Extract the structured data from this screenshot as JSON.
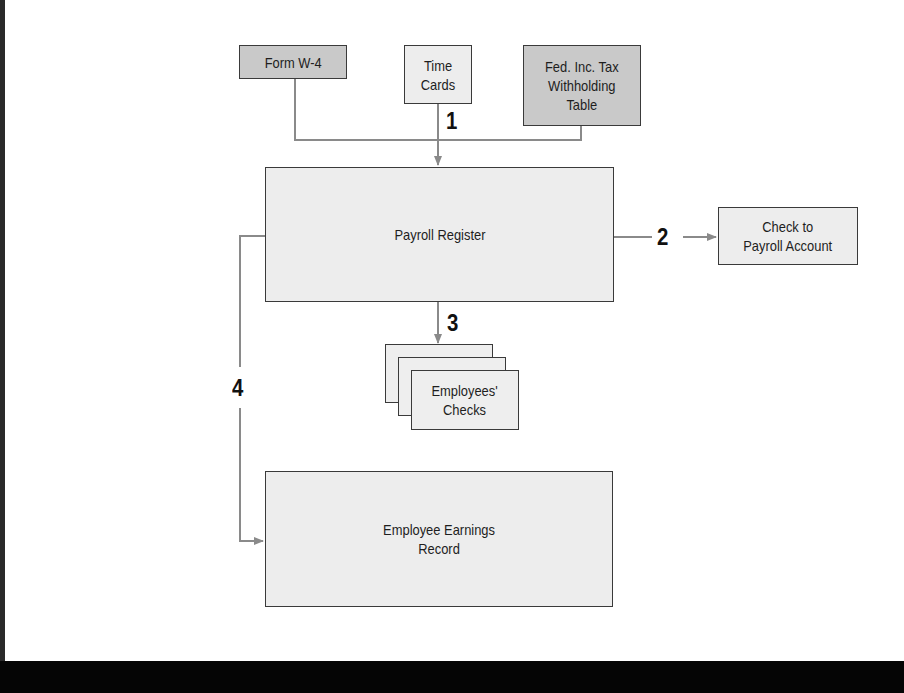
{
  "diagram": {
    "type": "flowchart",
    "topic": "Payroll procedure flow",
    "nodes": {
      "form_w4": {
        "label": "Form W-4"
      },
      "time_cards": {
        "label": "Time\nCards"
      },
      "fed_table": {
        "label": "Fed. Inc. Tax\nWithholding\nTable"
      },
      "payroll_register": {
        "label": "Payroll Register"
      },
      "check_payroll_account": {
        "label": "Check to\nPayroll Account"
      },
      "employees_checks": {
        "label": "Employees'\nChecks"
      },
      "earnings_record": {
        "label": "Employee Earnings\nRecord"
      }
    },
    "steps": {
      "s1": "1",
      "s2": "2",
      "s3": "3",
      "s4": "4"
    },
    "edges": [
      {
        "from": "form_w4",
        "to": "payroll_register",
        "step": "1"
      },
      {
        "from": "time_cards",
        "to": "payroll_register",
        "step": "1"
      },
      {
        "from": "fed_table",
        "to": "payroll_register",
        "step": "1"
      },
      {
        "from": "payroll_register",
        "to": "check_payroll_account",
        "step": "2"
      },
      {
        "from": "payroll_register",
        "to": "employees_checks",
        "step": "3"
      },
      {
        "from": "payroll_register",
        "to": "earnings_record",
        "step": "4"
      }
    ],
    "colors": {
      "dark_box": "#c9c9c9",
      "light_box": "#ededed",
      "line": "#8a8a8a",
      "border": "#3a3a3a"
    }
  }
}
